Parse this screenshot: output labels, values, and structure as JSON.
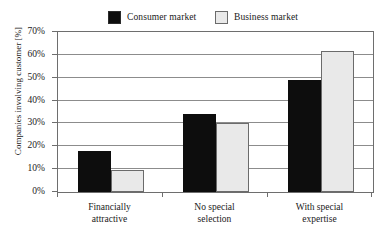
{
  "chart_data": {
    "type": "bar",
    "title": "",
    "subtitle": "",
    "xlabel": "",
    "ylabel": "Companies involving customer [%]",
    "ylim": [
      0,
      70
    ],
    "ytick_step": 10,
    "yticks": [
      "0%",
      "10%",
      "20%",
      "30%",
      "40%",
      "50%",
      "60%",
      "70%"
    ],
    "ytick_values": [
      0,
      10,
      20,
      30,
      40,
      50,
      60,
      70
    ],
    "grid": true,
    "grid_axis": "y",
    "legend_position": "top-center",
    "categories": [
      "Financially attractive",
      "No special selection",
      "With special expertise"
    ],
    "category_lines": [
      [
        "Financially",
        "attractive"
      ],
      [
        "No special",
        "selection"
      ],
      [
        "With special",
        "expertise"
      ]
    ],
    "series": [
      {
        "name": "Consumer market",
        "color": "#0d0d0d",
        "edge_color": "#0d0d0d",
        "values": [
          18,
          34,
          49
        ]
      },
      {
        "name": "Business market",
        "color": "#e9e9e9",
        "edge_color": "#6b6b6b",
        "values": [
          9.5,
          30,
          61.5
        ]
      }
    ]
  },
  "legend": {
    "entries": [
      {
        "label": "Consumer market",
        "swatch": "#0d0d0d",
        "swatch_border": "#2b2b2b"
      },
      {
        "label": "Business market",
        "swatch": "#e9e9e9",
        "swatch_border": "#6b6b6b"
      }
    ]
  },
  "colors": {
    "consumer": "#0d0d0d",
    "business": "#e9e9e9",
    "axis": "#6e6e6e",
    "grid": "#8c8c8c",
    "background": "#ffffff",
    "text": "#1a1a1a"
  }
}
